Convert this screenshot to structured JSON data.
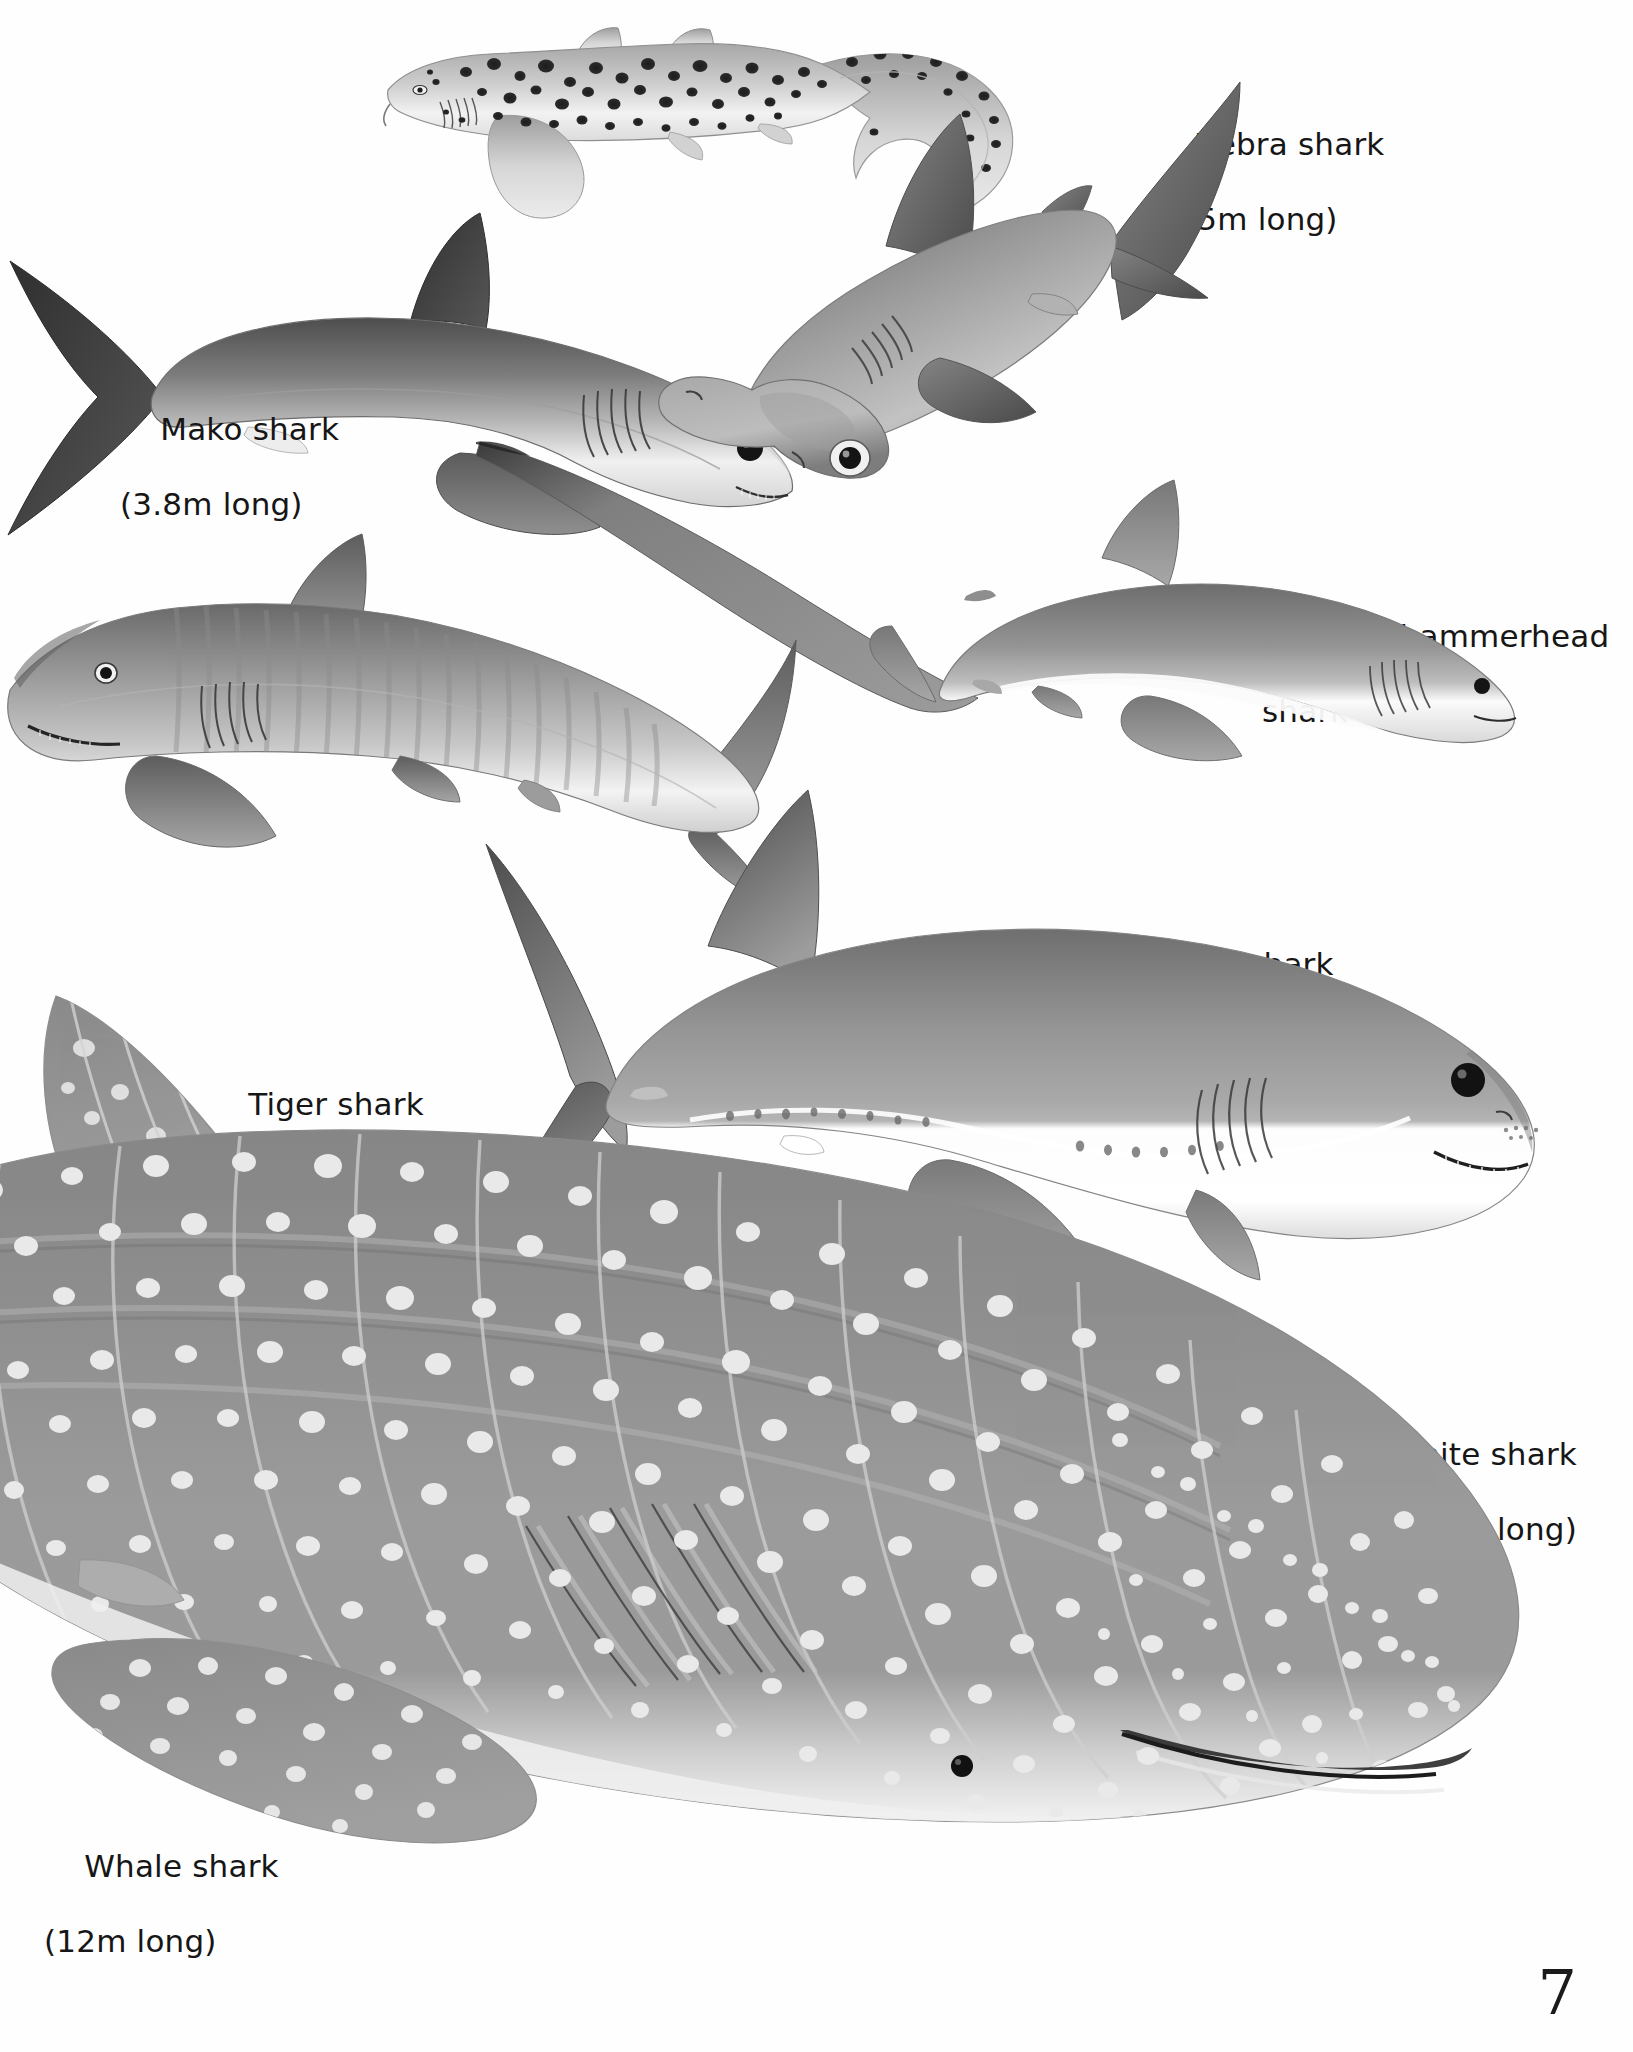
{
  "page": {
    "page_number": "7",
    "background_color": "#ffffff",
    "text_color": "#161616"
  },
  "labels": [
    {
      "id": "zebra",
      "name": "Zebra shark",
      "size": "(3.5m long)",
      "align": "left"
    },
    {
      "id": "mako",
      "name": "Mako shark",
      "size": "(3.8m long)",
      "align": "left"
    },
    {
      "id": "hammerhead",
      "name": "Great hammerhead",
      "size": "shark (4m long)",
      "align": "left"
    },
    {
      "id": "thresher",
      "name": "Thresher shark",
      "size": "(4.5m long)",
      "align": "left"
    },
    {
      "id": "tiger",
      "name": "Tiger shark",
      "size": "(5m long)",
      "align": "left"
    },
    {
      "id": "greatwhite",
      "name": "Great white shark",
      "size": "(6m long)",
      "align": "right"
    },
    {
      "id": "whale",
      "name": "Whale shark",
      "size": "(12m long)",
      "align": "left"
    }
  ],
  "illustrations": [
    {
      "id": "zebra",
      "species": "Zebra shark",
      "length_m": 3.5,
      "facing": "left",
      "pattern": "dark spots on pale body, long curving tail"
    },
    {
      "id": "mako",
      "species": "Mako shark",
      "length_m": 3.8,
      "facing": "right",
      "pattern": "dark grey back, white belly, crescent tail"
    },
    {
      "id": "hammerhead",
      "species": "Great hammerhead shark",
      "length_m": 4.0,
      "facing": "lower-left",
      "pattern": "grey, flattened hammer head, tall dorsal fin"
    },
    {
      "id": "thresher",
      "species": "Thresher shark",
      "length_m": 4.5,
      "facing": "right",
      "pattern": "grey back, white flank stripe, very long scythe tail"
    },
    {
      "id": "tiger",
      "species": "Tiger shark",
      "length_m": 5.0,
      "facing": "left",
      "pattern": "grey with faint vertical bars, blunt snout"
    },
    {
      "id": "greatwhite",
      "species": "Great white shark",
      "length_m": 6.0,
      "facing": "right",
      "pattern": "grey above, sharply demarcated white belly, conical snout"
    },
    {
      "id": "whale",
      "species": "Whale shark",
      "length_m": 12.0,
      "facing": "right",
      "pattern": "grey with white spots and pale checker stripes, ridged flanks, broad flat head"
    }
  ],
  "palette": {
    "ink": "#161616",
    "shark_dark": "#4b4b4b",
    "shark_mid": "#8d8d8d",
    "shark_light": "#c9c9c9",
    "belly": "#f4f4f4",
    "whale_body": "#8e8e8e",
    "whale_spot": "#e8e8e8",
    "mako_fin": "#3a3a3a"
  }
}
